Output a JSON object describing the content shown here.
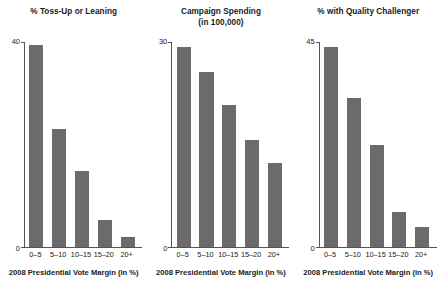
{
  "figure": {
    "width": 442,
    "height": 291,
    "bar_color": "#6b6b6b",
    "axis_color": "#555555",
    "background": "#ffffff"
  },
  "shared": {
    "xlabel": "2008 Presidential Vote Margin (in %)",
    "categories": [
      "0–5",
      "5–10",
      "10–15",
      "15–20",
      "20+"
    ]
  },
  "chart_data": [
    {
      "type": "bar",
      "title": "% Toss-Up or Leaning",
      "xlabel": "2008 Presidential Vote Margin (in %)",
      "ylabel": "",
      "categories": [
        "0–5",
        "5–10",
        "10–15",
        "15–20",
        "20+"
      ],
      "values": [
        39.5,
        23.0,
        14.8,
        5.2,
        1.9
      ],
      "ylim": [
        0,
        40
      ],
      "yticks": [
        0,
        40
      ],
      "ytick_labels": [
        "0",
        "40"
      ],
      "grid": false,
      "legend": "none"
    },
    {
      "type": "bar",
      "title": "Campaign Spending\n(in 100,000)",
      "xlabel": "2008 Presidential Vote Margin (in %)",
      "ylabel": "",
      "categories": [
        "0–5",
        "5–10",
        "10–15",
        "15–20",
        "20+"
      ],
      "values": [
        29.3,
        25.6,
        20.8,
        15.7,
        12.3
      ],
      "ylim": [
        0,
        30
      ],
      "yticks": [
        0,
        30
      ],
      "ytick_labels": [
        "0",
        "30"
      ],
      "grid": false,
      "legend": "none"
    },
    {
      "type": "bar",
      "title": "% with Quality Challenger",
      "xlabel": "2008 Presidential Vote Margin (in %)",
      "ylabel": "",
      "categories": [
        "0–5",
        "5–10",
        "10–15",
        "15–20",
        "20+"
      ],
      "values": [
        44.0,
        32.8,
        22.5,
        7.6,
        4.4
      ],
      "ylim": [
        0,
        45
      ],
      "yticks": [
        0,
        45
      ],
      "ytick_labels": [
        "0",
        "45"
      ],
      "grid": false,
      "legend": "none"
    }
  ]
}
